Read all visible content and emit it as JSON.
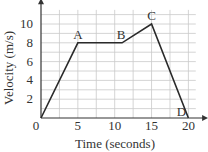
{
  "chart_data": {
    "type": "line",
    "title": "",
    "xlabel": "Time (seconds)",
    "ylabel": "Velocity (m/s)",
    "xlim": [
      0,
      20
    ],
    "ylim": [
      0,
      11.5
    ],
    "grid": true,
    "x_ticks": [
      "0",
      "5",
      "10",
      "15",
      "20"
    ],
    "y_ticks": [
      "2",
      "4",
      "6",
      "8",
      "10"
    ],
    "series": [
      {
        "name": "velocity",
        "x": [
          0,
          5,
          11,
          15,
          20
        ],
        "y": [
          0,
          8,
          8,
          10,
          0
        ]
      }
    ],
    "annotations": [
      {
        "text": "A",
        "x": 5,
        "y": 8
      },
      {
        "text": "B",
        "x": 11,
        "y": 8
      },
      {
        "text": "C",
        "x": 15,
        "y": 10
      },
      {
        "text": "D",
        "x": 20,
        "y": 0
      }
    ],
    "origin_label": "0"
  }
}
